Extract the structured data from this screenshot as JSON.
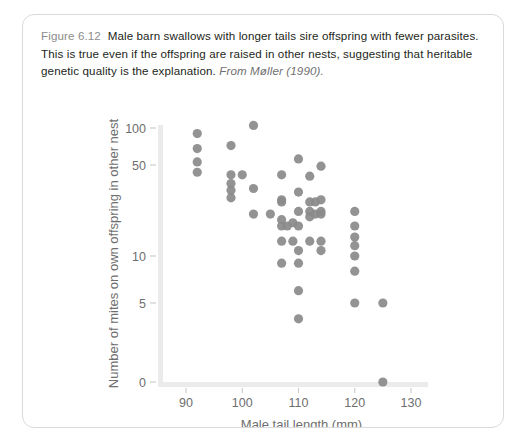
{
  "caption": {
    "figure_label": "Figure 6.12",
    "body": "Male barn swallows with longer tails sire offspring with fewer parasites. This is true even if the offspring are raised in other nests, suggesting that heritable genetic quality is the explanation.",
    "source": "From Møller (1990)."
  },
  "colors": {
    "point": "#8a8a8a",
    "axis": "#ebebeb",
    "tick_text": "#6e6e6e",
    "caption_text": "#231f20",
    "figure_label": "#8d8d8d",
    "card_border": "#d9d9d9",
    "background": "#ffffff"
  },
  "chart_data": {
    "type": "scatter",
    "title": "",
    "xlabel": "Male tail length (mm)",
    "ylabel": "Number of mites on own offspring in other nest",
    "xlim": [
      88,
      132
    ],
    "ylim": [
      0,
      115
    ],
    "yscale": "log-like with zero baseline",
    "grid": false,
    "legend": "none",
    "xticks": [
      90,
      100,
      110,
      120,
      130
    ],
    "xtick_labels": [
      "90",
      "100",
      "110",
      "120",
      "130"
    ],
    "yticks": [
      0,
      5,
      10,
      50,
      100
    ],
    "ytick_labels": [
      "0",
      "5",
      "10",
      "50",
      "100"
    ],
    "points": [
      {
        "x": 92,
        "y": 90
      },
      {
        "x": 92,
        "y": 68
      },
      {
        "x": 92,
        "y": 53
      },
      {
        "x": 92,
        "y": 44
      },
      {
        "x": 98,
        "y": 72
      },
      {
        "x": 98,
        "y": 42
      },
      {
        "x": 98,
        "y": 36
      },
      {
        "x": 98,
        "y": 32
      },
      {
        "x": 98,
        "y": 28
      },
      {
        "x": 100,
        "y": 42
      },
      {
        "x": 102,
        "y": 105
      },
      {
        "x": 102,
        "y": 33
      },
      {
        "x": 102,
        "y": 21
      },
      {
        "x": 105,
        "y": 21
      },
      {
        "x": 107,
        "y": 42
      },
      {
        "x": 107,
        "y": 27
      },
      {
        "x": 107,
        "y": 26
      },
      {
        "x": 107,
        "y": 19
      },
      {
        "x": 107,
        "y": 17
      },
      {
        "x": 107,
        "y": 13
      },
      {
        "x": 107,
        "y": 9
      },
      {
        "x": 108,
        "y": 17
      },
      {
        "x": 109,
        "y": 18
      },
      {
        "x": 109,
        "y": 13
      },
      {
        "x": 110,
        "y": 56
      },
      {
        "x": 110,
        "y": 31
      },
      {
        "x": 110,
        "y": 22
      },
      {
        "x": 110,
        "y": 17
      },
      {
        "x": 110,
        "y": 11
      },
      {
        "x": 110,
        "y": 9
      },
      {
        "x": 110,
        "y": 6
      },
      {
        "x": 110,
        "y": 4
      },
      {
        "x": 112,
        "y": 41
      },
      {
        "x": 112,
        "y": 26
      },
      {
        "x": 112,
        "y": 22
      },
      {
        "x": 112,
        "y": 20
      },
      {
        "x": 112,
        "y": 13
      },
      {
        "x": 113,
        "y": 26
      },
      {
        "x": 113,
        "y": 21
      },
      {
        "x": 114,
        "y": 49
      },
      {
        "x": 114,
        "y": 27
      },
      {
        "x": 114,
        "y": 22
      },
      {
        "x": 114,
        "y": 21
      },
      {
        "x": 114,
        "y": 13
      },
      {
        "x": 114,
        "y": 11
      },
      {
        "x": 120,
        "y": 22
      },
      {
        "x": 120,
        "y": 17
      },
      {
        "x": 120,
        "y": 14
      },
      {
        "x": 120,
        "y": 12
      },
      {
        "x": 120,
        "y": 10
      },
      {
        "x": 120,
        "y": 8
      },
      {
        "x": 120,
        "y": 5
      },
      {
        "x": 125,
        "y": 5
      },
      {
        "x": 125,
        "y": 0
      }
    ]
  }
}
